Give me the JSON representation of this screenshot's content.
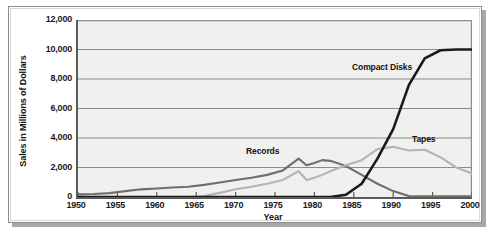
{
  "chart_data": {
    "type": "line",
    "title": "",
    "xlabel": "Year",
    "ylabel": "Sales in Millions of Dollars",
    "xlim": [
      1950,
      2000
    ],
    "ylim": [
      0,
      12000
    ],
    "grid": true,
    "legend_position": "inline-annotations",
    "xticks": [
      "1950",
      "1955",
      "1960",
      "1965",
      "1970",
      "1975",
      "1980",
      "1985",
      "1990",
      "1995",
      "2000"
    ],
    "yticks": [
      "0",
      "2,000",
      "4,000",
      "6,000",
      "8,000",
      "10,000",
      "12,000"
    ],
    "x": [
      1950,
      1952,
      1954,
      1956,
      1958,
      1960,
      1962,
      1964,
      1966,
      1968,
      1970,
      1972,
      1974,
      1976,
      1978,
      1979,
      1980,
      1981,
      1982,
      1984,
      1986,
      1988,
      1990,
      1992,
      1994,
      1996,
      1998,
      2000
    ],
    "series": [
      {
        "name": "Records",
        "color": "#6e6e6e",
        "values": [
          180,
          200,
          260,
          400,
          520,
          580,
          640,
          700,
          820,
          980,
          1150,
          1300,
          1500,
          1800,
          2600,
          2150,
          2300,
          2500,
          2450,
          2100,
          1500,
          900,
          400,
          60,
          40,
          40,
          40,
          40
        ]
      },
      {
        "name": "Tapes",
        "color": "#b4b4b4",
        "values": [
          0,
          0,
          0,
          0,
          0,
          0,
          0,
          0,
          60,
          280,
          520,
          700,
          900,
          1150,
          1750,
          1150,
          1300,
          1500,
          1750,
          2150,
          2500,
          3250,
          3400,
          3150,
          3200,
          2700,
          2000,
          1600
        ]
      },
      {
        "name": "Compact Disks",
        "color": "#1a1a1a",
        "values": [
          0,
          0,
          0,
          0,
          0,
          0,
          0,
          0,
          0,
          0,
          0,
          0,
          0,
          0,
          0,
          0,
          0,
          0,
          0,
          150,
          900,
          2600,
          4600,
          7600,
          9400,
          9950,
          10000,
          10000
        ]
      }
    ],
    "annotations": [
      {
        "label": "Records",
        "x_px": 246,
        "y_px": 146
      },
      {
        "label": "Tapes",
        "x_px": 412,
        "y_px": 134
      },
      {
        "label": "Compact Disks",
        "x_px": 352,
        "y_px": 62
      }
    ]
  },
  "figure": {
    "background": "#ffffff",
    "plot_background": "#f0f0ef",
    "axis_color": "#5a5a5a",
    "grid_color": "#8c8c8c"
  }
}
